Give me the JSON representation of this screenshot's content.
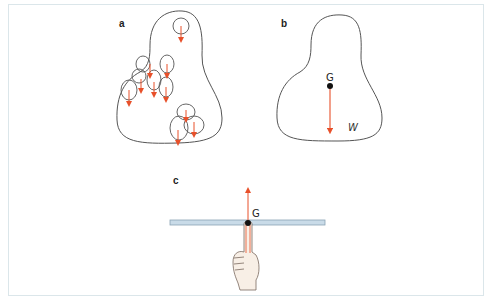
{
  "figure": {
    "panels": {
      "a": {
        "label": "a",
        "description": "irregular body divided into small parts each with its own weight arrow"
      },
      "b": {
        "label": "b",
        "centre_of_gravity_label": "G",
        "weight_label": "W"
      },
      "c": {
        "label": "c",
        "centre_of_gravity_label": "G",
        "description": "ruler balanced on a fingertip at its centre of gravity"
      }
    },
    "colors": {
      "outline": "#555555",
      "arrow": "#e8502a",
      "ruler_fill": "#c9dbe8",
      "ruler_stroke": "#8aa3b5",
      "frame": "#dbe6ea",
      "point": "#111111",
      "hand_fill": "#f8efe6",
      "hand_stroke": "#7a6a60"
    }
  }
}
